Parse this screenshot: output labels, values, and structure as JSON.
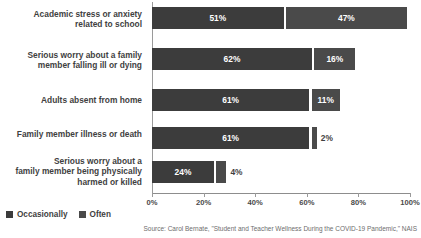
{
  "chart_data": {
    "type": "bar",
    "orientation": "horizontal",
    "stacked": true,
    "title": "",
    "xlabel": "",
    "ylabel": "",
    "xlim": [
      0,
      100
    ],
    "grid": false,
    "legend_position": "bottom-left",
    "categories": [
      "Academic stress or anxiety related to school",
      "Serious worry about a family member falling ill or dying",
      "Adults absent from home",
      "Family member illness or death",
      "Serious worry about a family member being physically harmed or killed"
    ],
    "category_lines": [
      [
        "Academic stress or anxiety",
        "related to school"
      ],
      [
        "Serious worry about a family",
        "member falling ill or dying"
      ],
      [
        "Adults absent from home"
      ],
      [
        "Family member illness or death"
      ],
      [
        "Serious worry about a",
        "family member being physically",
        "harmed or killed"
      ]
    ],
    "series": [
      {
        "name": "Occasionally",
        "values": [
          51,
          62,
          61,
          61,
          24
        ],
        "color": "#3c3c3c"
      },
      {
        "name": "Often",
        "values": [
          47,
          16,
          11,
          2,
          4
        ],
        "color": "#4a4a4a"
      }
    ],
    "value_labels": [
      [
        "51%",
        "47%"
      ],
      [
        "62%",
        "16%"
      ],
      [
        "61%",
        "11%"
      ],
      [
        "61%",
        "2%"
      ],
      [
        "24%",
        "4%"
      ]
    ],
    "xticks": [
      0,
      20,
      40,
      60,
      80,
      100
    ],
    "xtick_labels": [
      "0%",
      "20%",
      "40%",
      "60%",
      "80%",
      "100%"
    ]
  },
  "legend": {
    "items": [
      {
        "label": "Occasionally",
        "swatch": "occ"
      },
      {
        "label": "Often",
        "swatch": "oft"
      }
    ]
  },
  "source": {
    "text": "Source: Carol Bernate, \"Student and Teacher Wellness During the COVID-19 Pandemic,\" NAIS"
  }
}
